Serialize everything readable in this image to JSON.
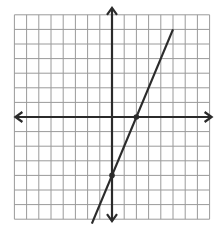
{
  "chart_data": {
    "type": "line",
    "title": "",
    "xlabel": "",
    "ylabel": "",
    "grid": true,
    "xlim": [
      -8,
      8
    ],
    "ylim": [
      -7,
      7
    ],
    "series": [
      {
        "name": "y = 2x - 4",
        "slope": 2,
        "intercept": -4,
        "x": [
          -1.65,
          5
        ],
        "y": [
          -7.3,
          6
        ],
        "marked_points": [
          {
            "label": "y-intercept",
            "x": 0,
            "y": -4
          },
          {
            "label": "x-intercept",
            "x": 2,
            "y": 0
          }
        ]
      }
    ]
  },
  "style": {
    "grid_color": "#9a9a9a",
    "axis_color": "#2b2b2b",
    "line_color": "#2b2b2b",
    "background": "#ffffff"
  },
  "layout": {
    "origin_px": [
      112,
      117
    ],
    "unit_x_px": 12.2,
    "unit_y_px": 14.6
  }
}
